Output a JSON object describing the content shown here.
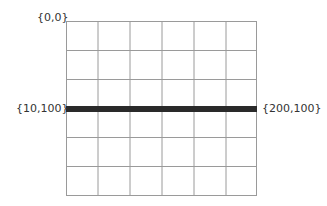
{
  "diagram": {
    "grid": {
      "columns": 6,
      "rows": 6,
      "line_color": "#9a9a9a"
    },
    "labels": {
      "origin": "{0,0}",
      "line_start": "{10,100}",
      "line_end": "{200,100}"
    },
    "line": {
      "from": [
        10,
        100
      ],
      "to": [
        200,
        100
      ],
      "color": "#2a2a2a"
    }
  }
}
